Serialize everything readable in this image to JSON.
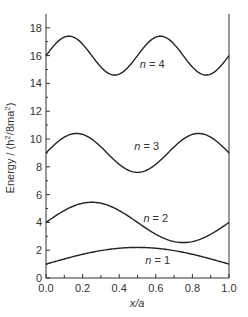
{
  "chart_data": {
    "type": "line",
    "title": "",
    "xlabel": "x/a",
    "ylabel": "Energy / (h²/8ma²)",
    "xlim": [
      0.0,
      1.0
    ],
    "ylim": [
      0,
      19
    ],
    "grid": false,
    "legend": "none",
    "x_ticks": [
      "0.0",
      "0.2",
      "0.4",
      "0.6",
      "0.8",
      "1.0"
    ],
    "y_ticks": [
      "0",
      "2",
      "4",
      "6",
      "8",
      "10",
      "12",
      "14",
      "16",
      "18"
    ],
    "series": [
      {
        "name": "n = 1",
        "n": 1,
        "baseline": 1,
        "amplitude": 1.2,
        "x": [
          0.0,
          0.25,
          0.5,
          0.75,
          1.0
        ],
        "values": [
          1.0,
          1.85,
          2.2,
          1.85,
          1.0
        ]
      },
      {
        "name": "n = 2",
        "n": 2,
        "baseline": 4,
        "amplitude": 1.45,
        "x": [
          0.0,
          0.25,
          0.5,
          0.75,
          1.0
        ],
        "values": [
          4.0,
          5.45,
          4.0,
          2.55,
          4.0
        ]
      },
      {
        "name": "n = 3",
        "n": 3,
        "baseline": 9,
        "amplitude": 1.4,
        "x": [
          0.0,
          0.1667,
          0.5,
          0.8333,
          1.0
        ],
        "values": [
          9.0,
          10.4,
          7.6,
          10.4,
          9.0
        ]
      },
      {
        "name": "n = 4",
        "n": 4,
        "baseline": 16,
        "amplitude": 1.4,
        "x": [
          0.0,
          0.125,
          0.375,
          0.625,
          0.875,
          1.0
        ],
        "values": [
          16.0,
          17.4,
          14.6,
          17.4,
          14.6,
          16.0
        ]
      }
    ],
    "annotations": [
      {
        "text": "n = 4",
        "x": 0.58,
        "y": 15.1
      },
      {
        "text": "n = 3",
        "x": 0.55,
        "y": 9.2
      },
      {
        "text": "n = 2",
        "x": 0.6,
        "y": 4.0
      },
      {
        "text": "n = 1",
        "x": 0.61,
        "y": 1.0
      }
    ]
  }
}
